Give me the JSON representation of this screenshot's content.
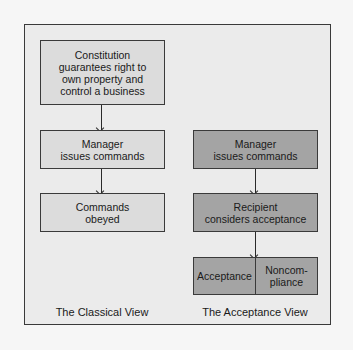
{
  "diagram": {
    "classical": {
      "caption": "The Classical View",
      "boxes": [
        {
          "text": "Constitution\nguarantees right to\nown property and\ncontrol a business"
        },
        {
          "text": "Manager\nissues commands"
        },
        {
          "text": "Commands\nobeyed"
        }
      ]
    },
    "acceptance": {
      "caption": "The Acceptance View",
      "boxes": [
        {
          "text": "Manager\nissues commands"
        },
        {
          "text": "Recipient\nconsiders acceptance"
        }
      ],
      "outcomes": [
        {
          "text": "Acceptance"
        },
        {
          "text": "Noncom-\npliance"
        }
      ]
    },
    "colors": {
      "frame_bg": "#ebebeb",
      "light_box": "#dcdcdc",
      "dark_box": "#a4a4a4",
      "border": "#3a3a3a"
    }
  }
}
